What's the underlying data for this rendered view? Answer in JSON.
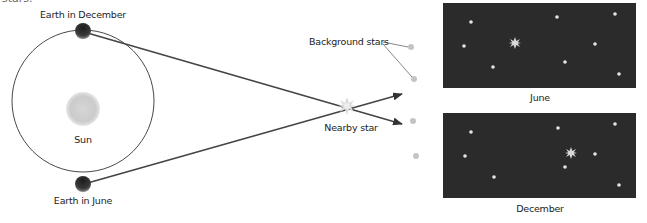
{
  "caption_fragment": "stars.",
  "labels": {
    "earth_december": "Earth in December",
    "earth_june": "Earth in June",
    "sun": "Sun",
    "background_stars": "Background stars",
    "nearby_star": "Nearby star",
    "panel_june": "June",
    "panel_december": "December"
  },
  "colors": {
    "orbit": "#333333",
    "earth": "#2a2a2a",
    "sun": "#c9c9c9",
    "sight_line": "#444444",
    "panel_bg": "#2b2b2b",
    "star": "#e8e8e8",
    "bg_star_outside": "#c8c8c8"
  },
  "panels": [
    {
      "name": "June",
      "nearby_star_position": "left-center"
    },
    {
      "name": "December",
      "nearby_star_position": "right-center"
    }
  ]
}
